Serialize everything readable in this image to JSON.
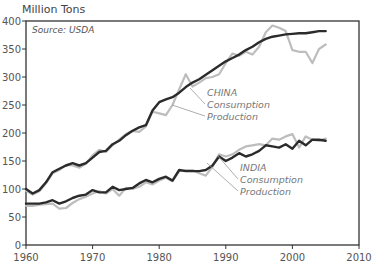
{
  "chart_data": {
    "type": "line",
    "title": "",
    "ylabel": "Million Tons",
    "xlabel": "",
    "source": "Source: USDA",
    "xlim": [
      1960,
      2010
    ],
    "ylim": [
      0,
      400
    ],
    "xticks": [
      1960,
      1970,
      1980,
      1990,
      2000,
      2010
    ],
    "yticks": [
      0,
      50,
      100,
      150,
      200,
      250,
      300,
      350,
      400
    ],
    "grid": false,
    "x": [
      1960,
      1961,
      1962,
      1963,
      1964,
      1965,
      1966,
      1967,
      1968,
      1969,
      1970,
      1971,
      1972,
      1973,
      1974,
      1975,
      1976,
      1977,
      1978,
      1979,
      1980,
      1981,
      1982,
      1983,
      1984,
      1985,
      1986,
      1987,
      1988,
      1989,
      1990,
      1991,
      1992,
      1993,
      1994,
      1995,
      1996,
      1997,
      1998,
      1999,
      2000,
      2001,
      2002,
      2003,
      2004,
      2005
    ],
    "series": [
      {
        "name": "China Production",
        "group": "CHINA",
        "kind": "Production",
        "color": "#bdbdbd",
        "values": [
          97,
          90,
          96,
          110,
          128,
          134,
          143,
          142,
          138,
          145,
          160,
          170,
          166,
          178,
          188,
          198,
          204,
          202,
          212,
          238,
          235,
          232,
          250,
          278,
          305,
          283,
          290,
          298,
          300,
          305,
          325,
          342,
          338,
          345,
          340,
          354,
          380,
          392,
          388,
          382,
          348,
          345,
          345,
          325,
          350,
          358
        ]
      },
      {
        "name": "China Consumption",
        "group": "CHINA",
        "kind": "Consumption",
        "color": "#2b2b2b",
        "values": [
          100,
          92,
          98,
          112,
          130,
          136,
          142,
          146,
          142,
          146,
          156,
          166,
          168,
          180,
          186,
          196,
          204,
          210,
          214,
          240,
          255,
          260,
          264,
          272,
          282,
          290,
          296,
          304,
          312,
          320,
          328,
          334,
          340,
          348,
          354,
          362,
          368,
          372,
          374,
          376,
          377,
          378,
          378,
          380,
          382,
          382
        ]
      },
      {
        "name": "India Production",
        "group": "INDIA",
        "kind": "Production",
        "color": "#bdbdbd",
        "values": [
          70,
          70,
          72,
          73,
          74,
          65,
          66,
          75,
          82,
          86,
          92,
          96,
          92,
          100,
          88,
          102,
          100,
          104,
          112,
          108,
          115,
          120,
          114,
          132,
          134,
          134,
          128,
          124,
          140,
          162,
          158,
          162,
          170,
          176,
          178,
          180,
          178,
          190,
          188,
          194,
          198,
          174,
          194,
          188,
          186,
          190
        ]
      },
      {
        "name": "India Consumption",
        "group": "INDIA",
        "kind": "Consumption",
        "color": "#2b2b2b",
        "values": [
          74,
          74,
          74,
          76,
          80,
          74,
          78,
          84,
          88,
          90,
          98,
          94,
          94,
          104,
          98,
          100,
          102,
          110,
          116,
          112,
          118,
          122,
          115,
          134,
          132,
          132,
          132,
          134,
          142,
          158,
          150,
          156,
          164,
          158,
          162,
          168,
          178,
          176,
          174,
          180,
          172,
          186,
          178,
          188,
          188,
          186
        ]
      }
    ],
    "annotations": [
      {
        "group": "CHINA",
        "lines": [
          "CHINA",
          "Consumption",
          "Production"
        ]
      },
      {
        "group": "INDIA",
        "lines": [
          "INDIA",
          "Consumption",
          "Production"
        ]
      }
    ]
  }
}
